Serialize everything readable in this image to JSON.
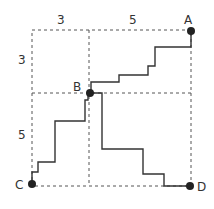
{
  "diagram": {
    "points": {
      "A": {
        "label": "A"
      },
      "B": {
        "label": "B"
      },
      "C": {
        "label": "C"
      },
      "D": {
        "label": "D"
      }
    },
    "dimensions": {
      "top_left": "3",
      "top_right": "5",
      "left_top": "3",
      "left_bottom": "5"
    },
    "colors": {
      "path": "#333333",
      "grid": "#555555",
      "dot": "#222222"
    }
  }
}
